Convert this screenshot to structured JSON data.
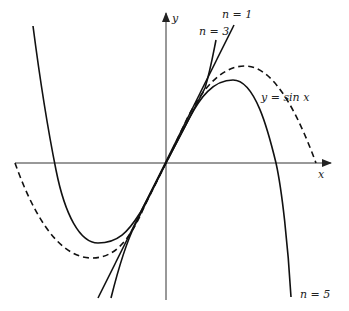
{
  "figure": {
    "axes": {
      "x_label": "x",
      "y_label": "y"
    },
    "labels": {
      "sin": "y = sin  x",
      "n1": "n = 1",
      "n3": "n = 3",
      "n5": "n = 5"
    },
    "curves": [
      {
        "name": "sin x",
        "style": "dashed"
      },
      {
        "name": "n = 1",
        "style": "solid"
      },
      {
        "name": "n = 3",
        "style": "solid"
      },
      {
        "name": "n = 5",
        "style": "solid"
      }
    ]
  }
}
